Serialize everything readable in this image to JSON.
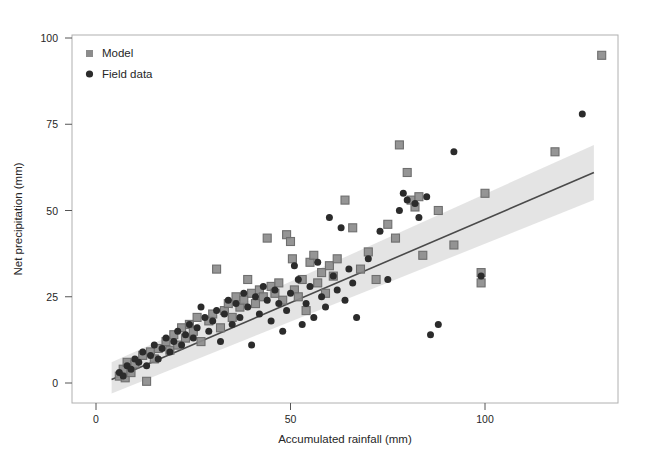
{
  "chart_data": {
    "type": "scatter",
    "title": "",
    "xlabel": "Accumulated rainfall (mm)",
    "ylabel": "Net precipitation (mm)",
    "xlim": [
      -3,
      136
    ],
    "ylim": [
      -5,
      101
    ],
    "xticks": [
      0,
      50,
      100
    ],
    "xticklabels": [
      "0",
      "50",
      "100"
    ],
    "yticks": [
      0,
      25,
      50,
      75,
      100
    ],
    "yticklabels": [
      "0",
      "25",
      "50",
      "75",
      "100"
    ],
    "grid": false,
    "legend_position": "top-left",
    "legend": [
      {
        "name": "Model",
        "marker": "square",
        "color": "#8c8c8c"
      },
      {
        "name": "Field data",
        "marker": "circle",
        "color": "#2b2b2b"
      }
    ],
    "series": [
      {
        "name": "Model",
        "marker": "square",
        "color": "#8c8c8c",
        "points": [
          [
            6,
            2
          ],
          [
            7,
            4
          ],
          [
            7.5,
            1.5
          ],
          [
            8,
            6
          ],
          [
            9,
            3
          ],
          [
            10,
            5.5
          ],
          [
            12,
            8
          ],
          [
            13,
            0.5
          ],
          [
            14,
            9
          ],
          [
            15,
            7
          ],
          [
            16,
            10
          ],
          [
            18,
            12
          ],
          [
            19,
            9.5
          ],
          [
            20,
            14
          ],
          [
            21,
            11
          ],
          [
            22,
            16
          ],
          [
            23,
            13
          ],
          [
            24,
            17
          ],
          [
            25,
            15
          ],
          [
            26,
            19
          ],
          [
            27,
            12
          ],
          [
            29,
            18
          ],
          [
            30,
            20
          ],
          [
            31,
            33
          ],
          [
            32,
            16
          ],
          [
            33,
            21
          ],
          [
            34,
            23
          ],
          [
            35,
            19
          ],
          [
            36,
            25
          ],
          [
            37,
            22
          ],
          [
            38,
            24
          ],
          [
            39,
            30
          ],
          [
            40,
            26
          ],
          [
            41,
            23
          ],
          [
            42,
            27
          ],
          [
            43,
            25
          ],
          [
            44,
            42
          ],
          [
            45,
            28
          ],
          [
            46,
            26
          ],
          [
            47,
            29
          ],
          [
            48,
            24
          ],
          [
            49,
            43
          ],
          [
            50,
            41
          ],
          [
            50.5,
            36
          ],
          [
            51,
            27
          ],
          [
            52,
            25
          ],
          [
            53,
            30
          ],
          [
            54,
            21
          ],
          [
            55,
            35
          ],
          [
            56,
            37
          ],
          [
            57,
            29
          ],
          [
            58,
            32
          ],
          [
            59,
            26
          ],
          [
            60,
            34
          ],
          [
            61,
            31
          ],
          [
            62,
            36
          ],
          [
            64,
            53
          ],
          [
            66,
            45
          ],
          [
            68,
            33
          ],
          [
            70,
            38
          ],
          [
            72,
            30
          ],
          [
            75,
            46
          ],
          [
            77,
            42
          ],
          [
            78,
            69
          ],
          [
            80,
            61
          ],
          [
            81,
            53
          ],
          [
            82,
            51
          ],
          [
            83,
            54
          ],
          [
            84,
            37
          ],
          [
            88,
            50
          ],
          [
            92,
            40
          ],
          [
            99,
            32
          ],
          [
            99,
            29
          ],
          [
            100,
            55
          ],
          [
            118,
            67
          ],
          [
            130,
            95
          ]
        ]
      },
      {
        "name": "Field data",
        "marker": "circle",
        "color": "#2b2b2b",
        "points": [
          [
            6,
            3
          ],
          [
            7,
            2
          ],
          [
            8,
            5
          ],
          [
            9,
            4
          ],
          [
            10,
            7
          ],
          [
            11,
            6
          ],
          [
            12,
            9
          ],
          [
            13,
            5
          ],
          [
            14,
            8
          ],
          [
            15,
            11
          ],
          [
            16,
            7
          ],
          [
            17,
            10
          ],
          [
            18,
            13
          ],
          [
            19,
            9
          ],
          [
            20,
            12
          ],
          [
            21,
            15
          ],
          [
            22,
            11
          ],
          [
            23,
            14
          ],
          [
            24,
            17
          ],
          [
            25,
            13
          ],
          [
            26,
            16
          ],
          [
            27,
            22
          ],
          [
            28,
            19
          ],
          [
            29,
            15
          ],
          [
            30,
            18
          ],
          [
            31,
            21
          ],
          [
            32,
            12
          ],
          [
            33,
            20
          ],
          [
            34,
            24
          ],
          [
            35,
            17
          ],
          [
            36,
            23
          ],
          [
            37,
            19
          ],
          [
            38,
            26
          ],
          [
            39,
            22
          ],
          [
            40,
            11
          ],
          [
            41,
            25
          ],
          [
            42,
            20
          ],
          [
            43,
            28
          ],
          [
            44,
            24
          ],
          [
            45,
            18
          ],
          [
            46,
            27
          ],
          [
            47,
            23
          ],
          [
            48,
            15
          ],
          [
            49,
            21
          ],
          [
            50,
            26
          ],
          [
            51,
            34
          ],
          [
            52,
            30
          ],
          [
            53,
            17
          ],
          [
            54,
            23
          ],
          [
            55,
            28
          ],
          [
            56,
            19
          ],
          [
            57,
            35
          ],
          [
            58,
            25
          ],
          [
            59,
            22
          ],
          [
            60,
            48
          ],
          [
            61,
            31
          ],
          [
            62,
            27
          ],
          [
            63,
            45
          ],
          [
            64,
            24
          ],
          [
            65,
            33
          ],
          [
            66,
            29
          ],
          [
            67,
            19
          ],
          [
            70,
            36
          ],
          [
            73,
            44
          ],
          [
            75,
            30
          ],
          [
            78,
            50
          ],
          [
            79,
            55
          ],
          [
            80,
            53
          ],
          [
            82,
            52
          ],
          [
            83,
            48
          ],
          [
            85,
            54
          ],
          [
            86,
            14
          ],
          [
            88,
            17
          ],
          [
            92,
            67
          ],
          [
            99,
            31
          ],
          [
            125,
            78
          ]
        ]
      }
    ],
    "fit_line": {
      "name": "regression",
      "color": "#4a4a4a",
      "x_start": 4,
      "y_start": 1,
      "x_end": 128,
      "y_end": 61
    },
    "confidence_band": {
      "color": "#d9d9d9",
      "opacity": 0.7,
      "x_start": 4,
      "x_end": 128,
      "lower_start": -3,
      "upper_start": 6,
      "lower_end": 53,
      "upper_end": 69
    }
  }
}
